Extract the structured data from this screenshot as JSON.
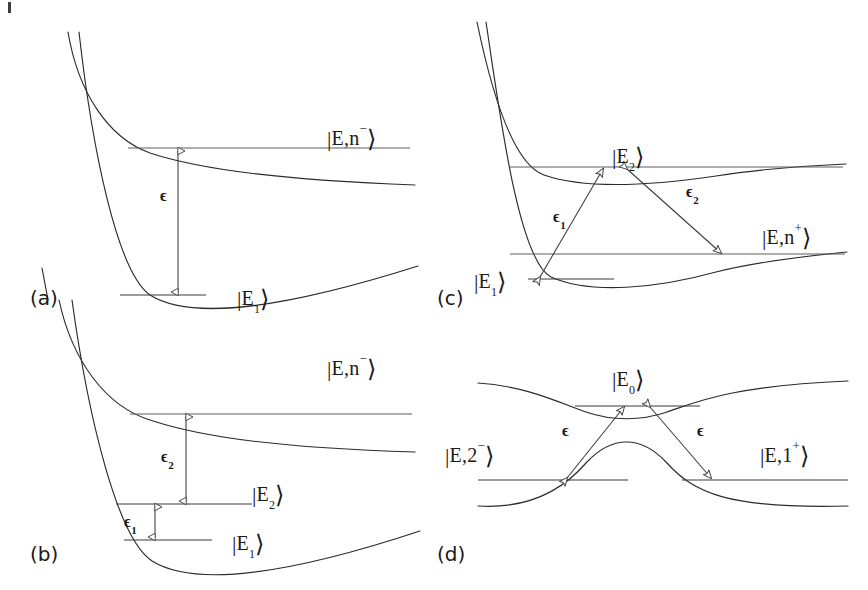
{
  "figure": {
    "type": "scientific-diagram",
    "width": 868,
    "height": 590,
    "background_color": "#ffffff",
    "curve_color": "#2b2b2b",
    "level_color": "#5d5d5d",
    "text_color": "#1a1a1a"
  },
  "panels": [
    {
      "tag": "(a)",
      "tag_x": 30,
      "tag_y": 297,
      "labels": [
        {
          "name": "state-En-minus",
          "text_parts": [
            "|",
            "E,n",
            "−",
            "⟩"
          ],
          "x": 327,
          "y": 125
        },
        {
          "name": "state-E1",
          "text_parts": [
            "|",
            "E",
            "1",
            "⟩"
          ],
          "x": 237,
          "y": 285
        }
      ],
      "energy_arrows": [
        {
          "name": "epsilon",
          "label": "ϵ",
          "sub": "",
          "x": 177,
          "y": 196
        }
      ]
    },
    {
      "tag": "(b)",
      "tag_x": 30,
      "tag_y": 553,
      "labels": [
        {
          "name": "state-En-minus",
          "text_parts": [
            "|",
            "E,n",
            "−",
            "⟩"
          ],
          "x": 327,
          "y": 355
        },
        {
          "name": "state-E2",
          "text_parts": [
            "|",
            "E",
            "2",
            "⟩"
          ],
          "x": 252,
          "y": 481
        },
        {
          "name": "state-E1",
          "text_parts": [
            "|",
            "E",
            "1",
            "⟩"
          ],
          "x": 232,
          "y": 542
        }
      ],
      "energy_arrows": [
        {
          "name": "epsilon-2",
          "label": "ϵ",
          "sub": "2",
          "x": 168,
          "y": 456
        },
        {
          "name": "epsilon-1",
          "label": "ϵ",
          "sub": "1",
          "x": 125,
          "y": 523
        }
      ]
    },
    {
      "tag": "(c)",
      "tag_x": 437,
      "tag_y": 297,
      "labels": [
        {
          "name": "state-E2",
          "text_parts": [
            "|",
            "E",
            "2",
            "⟩"
          ],
          "x": 612,
          "y": 143
        },
        {
          "name": "state-En-plus",
          "text_parts": [
            "|",
            "E,n",
            "+",
            "⟩"
          ],
          "x": 762,
          "y": 224
        },
        {
          "name": "state-E1",
          "text_parts": [
            "|",
            "E",
            "1",
            "⟩"
          ],
          "x": 474,
          "y": 276
        }
      ],
      "energy_arrows": [
        {
          "name": "epsilon-1",
          "label": "ϵ",
          "sub": "1",
          "x": 566,
          "y": 216
        },
        {
          "name": "epsilon-2",
          "label": "ϵ",
          "sub": "2",
          "x": 695,
          "y": 190
        }
      ]
    },
    {
      "tag": "(d)",
      "tag_x": 437,
      "tag_y": 553,
      "labels": [
        {
          "name": "state-E0",
          "text_parts": [
            "|",
            "E",
            "0",
            "⟩"
          ],
          "x": 612,
          "y": 366
        },
        {
          "name": "state-E2-minus",
          "text_parts": [
            "|",
            "E,2",
            "−",
            "⟩"
          ],
          "x": 445,
          "y": 442
        },
        {
          "name": "state-E1-plus",
          "text_parts": [
            "|",
            "E,1",
            "+",
            "⟩"
          ],
          "x": 760,
          "y": 442
        }
      ],
      "energy_arrows": [
        {
          "name": "epsilon-left",
          "label": "ϵ",
          "sub": "",
          "x": 568,
          "y": 424
        },
        {
          "name": "epsilon-right",
          "label": "ϵ",
          "sub": "",
          "x": 700,
          "y": 424
        }
      ]
    }
  ],
  "geometry": {
    "panel_a": {
      "upper_curve": "M 68,32 C 80,95 110,140 150,154 C 200,172 280,182 415,186",
      "lower_curve": "M 78,32 C 92,150 118,275 150,296 C 190,322 280,310 418,268",
      "level_upper": {
        "x1": 128,
        "x2": 410,
        "y": 148
      },
      "level_lower": {
        "x1": 120,
        "x2": 206,
        "y": 295
      },
      "arrow": {
        "x": 178,
        "y1": 149,
        "y2": 294
      }
    },
    "panel_b": {
      "upper_curve": "M 68,300 C 80,362 110,406 150,420 C 200,438 280,448 415,452",
      "lower_curve": "M 78,300 C 92,418 118,540 152,562 C 192,588 282,578 420,533",
      "level_upper": {
        "x1": 130,
        "x2": 412,
        "y": 414
      },
      "level_mid": {
        "x1": 116,
        "x2": 252,
        "y": 504
      },
      "level_lower": {
        "x1": 124,
        "x2": 212,
        "y": 540
      },
      "arrow_e2": {
        "x": 186,
        "y1": 415,
        "y2": 503
      },
      "arrow_e1": {
        "x": 154,
        "y1": 505,
        "y2": 539
      }
    },
    "panel_c": {
      "upper_curve": "M 478,22 C 492,82 512,165 545,176 C 585,190 650,186 718,176 C 760,170 800,166 845,164",
      "lower_curve": "M 487,22 C 500,110 520,262 552,278 C 592,296 660,288 718,272 C 760,262 805,256 846,252",
      "level_E2": {
        "x1": 510,
        "x2": 843,
        "y": 167
      },
      "level_En_plus": {
        "x1": 510,
        "x2": 845,
        "y": 254
      },
      "level_E1": {
        "x1": 528,
        "x2": 614,
        "y": 279
      },
      "arrow_e1": {
        "x1": 538,
        "y1": 278,
        "x2": 604,
        "y2": 168
      },
      "arrow_e2": {
        "x1": 626,
        "y1": 168,
        "x2": 722,
        "y2": 254
      }
    },
    "panel_d": {
      "upper_curve": "M 478,383 C 528,386 562,404 588,412 C 612,420 640,420 668,412 C 696,404 728,386 848,381",
      "lower_curve": "M 478,505 C 528,508 562,492 588,462 C 612,436 640,436 668,462 C 696,492 728,508 848,505",
      "level_E0": {
        "x1": 575,
        "x2": 700,
        "y": 406
      },
      "level_left": {
        "x1": 478,
        "x2": 628,
        "y": 480
      },
      "level_right": {
        "x1": 682,
        "x2": 848,
        "y": 480
      },
      "arrow_left": {
        "x1": 565,
        "y1": 479,
        "x2": 625,
        "y2": 406
      },
      "arrow_right": {
        "x1": 648,
        "y1": 406,
        "x2": 712,
        "y2": 479
      }
    }
  }
}
